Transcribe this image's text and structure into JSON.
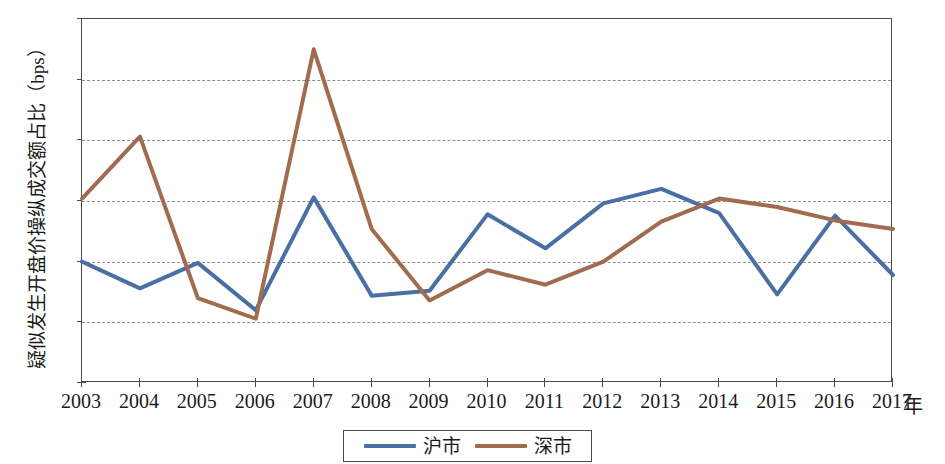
{
  "chart_data": {
    "type": "line",
    "title": "",
    "xlabel": "年",
    "ylabel": "疑似发生开盘价操纵成交额占比（bps）",
    "categories": [
      "2003",
      "2004",
      "2005",
      "2006",
      "2007",
      "2008",
      "2009",
      "2010",
      "2011",
      "2012",
      "2013",
      "2014",
      "2015",
      "2016",
      "2017"
    ],
    "x": [
      2003,
      2004,
      2005,
      2006,
      2007,
      2008,
      2009,
      2010,
      2011,
      2012,
      2013,
      2014,
      2015,
      2016,
      2017
    ],
    "series": [
      {
        "name": "沪市",
        "color": "#4a6fa5",
        "values": [
          1.0,
          0.78,
          0.99,
          0.6,
          1.53,
          0.72,
          0.76,
          1.39,
          1.11,
          1.48,
          1.6,
          1.4,
          0.73,
          1.38,
          0.89
        ]
      },
      {
        "name": "深市",
        "color": "#a06b4f",
        "values": [
          1.52,
          2.03,
          0.7,
          0.53,
          2.75,
          1.27,
          0.68,
          0.93,
          0.81,
          1.0,
          1.33,
          1.52,
          1.45,
          1.34,
          1.27
        ]
      }
    ],
    "ylim": [
      0,
      3
    ],
    "yticks": [
      0,
      0.5,
      1,
      1.5,
      2,
      2.5,
      3
    ],
    "ytick_labels": [
      "0",
      "0.5",
      "1",
      "1.5",
      "2",
      "2.5",
      "3"
    ],
    "grid": true,
    "grid_style": "dashed-horizontal",
    "legend_position": "bottom-center",
    "legend_entries": [
      "沪市",
      "深市"
    ]
  },
  "axis": {
    "y_title": "疑似发生开盘价操纵成交额占比（bps）",
    "x_unit": "年"
  }
}
